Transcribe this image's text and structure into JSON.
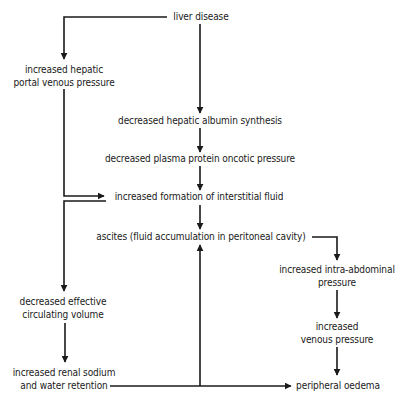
{
  "diagram": {
    "nodes": {
      "liver_disease": {
        "lines": [
          "liver disease"
        ]
      },
      "portal_pressure": {
        "lines": [
          "increased hepatic",
          "portal venous pressure"
        ]
      },
      "albumin_synthesis": {
        "lines": [
          "decreased hepatic albumin synthesis"
        ]
      },
      "oncotic_pressure": {
        "lines": [
          "decreased plasma protein oncotic pressure"
        ]
      },
      "interstitial_fluid": {
        "lines": [
          "increased formation of interstitial fluid"
        ]
      },
      "ascites": {
        "lines": [
          "ascites (fluid accumulation in peritoneal cavity)"
        ]
      },
      "intra_abdominal": {
        "lines": [
          "increased intra-abdominal",
          "pressure"
        ]
      },
      "venous_pressure": {
        "lines": [
          "increased",
          "venous pressure"
        ]
      },
      "circulating_volume": {
        "lines": [
          "decreased effective",
          "circulating volume"
        ]
      },
      "renal_retention": {
        "lines": [
          "increased renal sodium",
          "and water retention"
        ]
      },
      "peripheral_oedema": {
        "lines": [
          "peripheral oedema"
        ]
      }
    },
    "edges": [
      {
        "from": "liver_disease",
        "to": "portal_pressure"
      },
      {
        "from": "liver_disease",
        "to": "albumin_synthesis"
      },
      {
        "from": "albumin_synthesis",
        "to": "oncotic_pressure"
      },
      {
        "from": "oncotic_pressure",
        "to": "interstitial_fluid"
      },
      {
        "from": "portal_pressure",
        "to": "interstitial_fluid"
      },
      {
        "from": "interstitial_fluid",
        "to": "ascites"
      },
      {
        "from": "ascites",
        "to": "intra_abdominal"
      },
      {
        "from": "intra_abdominal",
        "to": "venous_pressure"
      },
      {
        "from": "venous_pressure",
        "to": "peripheral_oedema"
      },
      {
        "from": "interstitial_fluid",
        "to": "circulating_volume"
      },
      {
        "from": "circulating_volume",
        "to": "renal_retention"
      },
      {
        "from": "renal_retention",
        "to": "peripheral_oedema"
      },
      {
        "from": "renal_retention",
        "to": "ascites"
      }
    ],
    "colors": {
      "line": "#1a1a1a",
      "text": "#1a1a1a",
      "background": "#ffffff"
    }
  }
}
